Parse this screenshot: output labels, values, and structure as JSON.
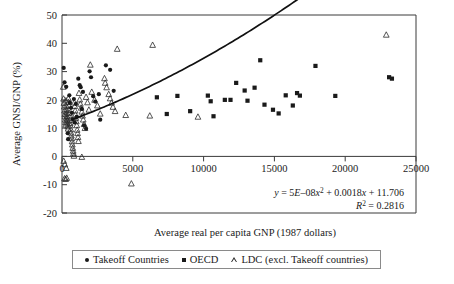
{
  "chart_data": {
    "type": "scatter",
    "title": "",
    "xlabel": "Average real per capita GNP (1987 dollars)",
    "ylabel": "Average GNSI/GNP (%)",
    "xlim": [
      0,
      25000
    ],
    "ylim": [
      -20,
      50
    ],
    "xticks": [
      0,
      5000,
      10000,
      15000,
      20000,
      25000
    ],
    "xticklabels": [
      "0",
      "5000",
      "10000",
      "15000",
      "20000",
      "25000"
    ],
    "yticks": [
      -20,
      -10,
      0,
      10,
      20,
      30,
      40,
      50
    ],
    "yticklabels": [
      "-20",
      "-10",
      "0",
      "10",
      "20",
      "30",
      "40",
      "50"
    ],
    "grid": false,
    "legend_position": "below-axes",
    "annotations": {
      "equation": "y = 5E–08x2 + 0.0018x + 11.706",
      "equation_display": "y = 5E–08x² + 0.0018x + 11.706",
      "r_squared": "R² = 0.2816",
      "r_squared_value": 0.2816,
      "coefficients": {
        "a": 5e-08,
        "b": 0.0018,
        "c": 11.706
      }
    },
    "legend": [
      {
        "label": "Takeoff Countries",
        "marker": "circle"
      },
      {
        "label": "OECD",
        "marker": "square"
      },
      {
        "label": "LDC (excl. Takeoff countries)",
        "marker": "triangle"
      }
    ],
    "series": [
      {
        "name": "Takeoff Countries",
        "marker": "circle",
        "points": [
          [
            120,
            31.3
          ],
          [
            180,
            26.2
          ],
          [
            300,
            24.6
          ],
          [
            520,
            21.6
          ],
          [
            560,
            19.0
          ],
          [
            640,
            17.2
          ],
          [
            700,
            15.4
          ],
          [
            760,
            13.2
          ],
          [
            840,
            20.3
          ],
          [
            900,
            12.0
          ],
          [
            980,
            18.6
          ],
          [
            1050,
            14.0
          ],
          [
            1150,
            27.5
          ],
          [
            1250,
            25.2
          ],
          [
            1320,
            24.5
          ],
          [
            1400,
            16.8
          ],
          [
            1480,
            22.8
          ],
          [
            1560,
            11.0
          ],
          [
            1700,
            9.8
          ],
          [
            1950,
            30.1
          ],
          [
            2050,
            28.0
          ],
          [
            2200,
            21.3
          ],
          [
            2350,
            19.4
          ],
          [
            2600,
            22.0
          ],
          [
            2700,
            13.0
          ],
          [
            3100,
            32.2
          ],
          [
            3400,
            30.6
          ],
          [
            3650,
            23.2
          ],
          [
            400,
            8.2
          ],
          [
            430,
            6.1
          ]
        ]
      },
      {
        "name": "OECD",
        "marker": "square",
        "points": [
          [
            8150,
            21.4
          ],
          [
            9050,
            16.0
          ],
          [
            10300,
            21.5
          ],
          [
            10500,
            19.5
          ],
          [
            10700,
            14.2
          ],
          [
            11500,
            20.0
          ],
          [
            11900,
            20.0
          ],
          [
            12300,
            26.0
          ],
          [
            12900,
            23.3
          ],
          [
            13100,
            19.7
          ],
          [
            13600,
            24.3
          ],
          [
            14000,
            34.0
          ],
          [
            14300,
            18.3
          ],
          [
            14900,
            16.5
          ],
          [
            15300,
            15.2
          ],
          [
            15800,
            21.6
          ],
          [
            16300,
            18.0
          ],
          [
            16600,
            22.4
          ],
          [
            16800,
            21.5
          ],
          [
            17900,
            32.0
          ],
          [
            19300,
            21.4
          ],
          [
            23100,
            28.0
          ],
          [
            23300,
            27.5
          ],
          [
            6700,
            20.9
          ],
          [
            7400,
            15.0
          ]
        ]
      },
      {
        "name": "LDC (excl. Takeoff countries)",
        "marker": "triangle",
        "points": [
          [
            90,
            24.6
          ],
          [
            110,
            20.4
          ],
          [
            140,
            18.9
          ],
          [
            160,
            17.6
          ],
          [
            180,
            16.2
          ],
          [
            200,
            15.0
          ],
          [
            210,
            14.1
          ],
          [
            230,
            13.0
          ],
          [
            250,
            12.1
          ],
          [
            260,
            11.2
          ],
          [
            280,
            19.8
          ],
          [
            300,
            18.0
          ],
          [
            310,
            16.6
          ],
          [
            330,
            15.5
          ],
          [
            350,
            14.3
          ],
          [
            360,
            13.4
          ],
          [
            380,
            12.6
          ],
          [
            400,
            11.6
          ],
          [
            410,
            10.6
          ],
          [
            430,
            9.8
          ],
          [
            450,
            20.5
          ],
          [
            470,
            19.2
          ],
          [
            490,
            17.9
          ],
          [
            500,
            16.4
          ],
          [
            520,
            15.3
          ],
          [
            540,
            14.0
          ],
          [
            560,
            12.9
          ],
          [
            580,
            11.8
          ],
          [
            600,
            10.9
          ],
          [
            620,
            9.6
          ],
          [
            640,
            8.4
          ],
          [
            660,
            7.4
          ],
          [
            690,
            6.4
          ],
          [
            710,
            5.3
          ],
          [
            730,
            4.2
          ],
          [
            760,
            3.0
          ],
          [
            790,
            2.0
          ],
          [
            810,
            1.1
          ],
          [
            840,
            0.2
          ],
          [
            870,
            19.0
          ],
          [
            900,
            17.8
          ],
          [
            930,
            16.2
          ],
          [
            950,
            14.8
          ],
          [
            980,
            13.6
          ],
          [
            1010,
            12.4
          ],
          [
            1040,
            11.0
          ],
          [
            1070,
            9.4
          ],
          [
            1100,
            8.2
          ],
          [
            1130,
            6.8
          ],
          [
            1160,
            5.4
          ],
          [
            1200,
            22.4
          ],
          [
            1250,
            20.1
          ],
          [
            1300,
            18.6
          ],
          [
            1350,
            17.2
          ],
          [
            1400,
            15.8
          ],
          [
            1450,
            14.4
          ],
          [
            1500,
            13.0
          ],
          [
            1560,
            11.4
          ],
          [
            1620,
            10.0
          ],
          [
            1700,
            21.0
          ],
          [
            1800,
            19.1
          ],
          [
            1900,
            16.5
          ],
          [
            2000,
            32.4
          ],
          [
            2100,
            22.8
          ],
          [
            2300,
            20.0
          ],
          [
            2500,
            18.0
          ],
          [
            2700,
            15.1
          ],
          [
            3000,
            27.6
          ],
          [
            3050,
            26.0
          ],
          [
            3150,
            24.4
          ],
          [
            3300,
            22.0
          ],
          [
            3400,
            20.5
          ],
          [
            3500,
            19.0
          ],
          [
            3600,
            17.5
          ],
          [
            3750,
            16.0
          ],
          [
            3900,
            38.0
          ],
          [
            4500,
            14.6
          ],
          [
            6200,
            14.4
          ],
          [
            6400,
            39.4
          ],
          [
            9600,
            14.0
          ],
          [
            22900,
            43.0
          ],
          [
            180,
            -7.8
          ],
          [
            260,
            -8.0
          ],
          [
            330,
            -7.6
          ],
          [
            1400,
            -0.2
          ],
          [
            4900,
            -9.6
          ],
          [
            120,
            -1.6
          ],
          [
            200,
            -2.8
          ],
          [
            300,
            -4.1
          ]
        ]
      }
    ],
    "trendline": {
      "type": "quadratic",
      "equation": "y = 5E-08x^2 + 0.0018x + 11.706",
      "x_range": [
        700,
        23400
      ]
    }
  },
  "legend_box": {
    "items": [
      "Takeoff Countries",
      "OECD",
      "LDC (excl. Takeoff countries)"
    ]
  }
}
